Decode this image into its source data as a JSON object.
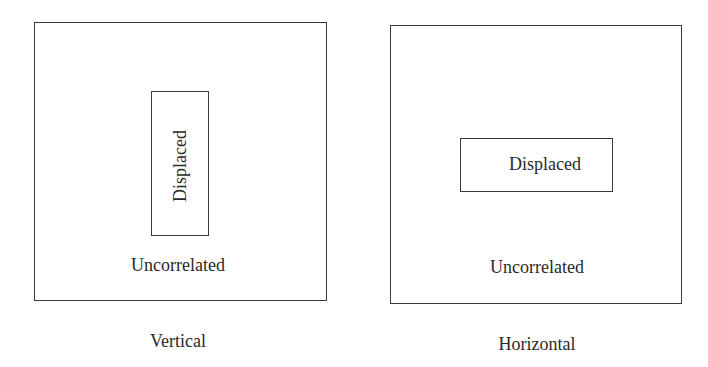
{
  "panels": [
    {
      "caption": "Vertical",
      "outer_label": "Uncorrelated",
      "inner_label": "Displaced",
      "inner_orientation": "vertical"
    },
    {
      "caption": "Horizontal",
      "outer_label": "Uncorrelated",
      "inner_label": "Displaced",
      "inner_orientation": "horizontal"
    }
  ]
}
